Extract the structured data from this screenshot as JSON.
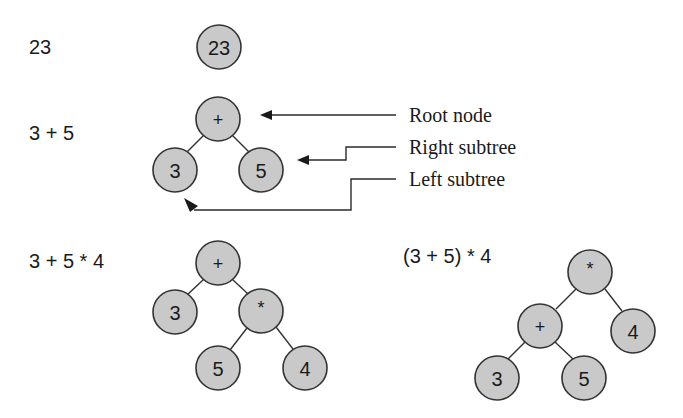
{
  "diagram": {
    "type": "expression-tree-illustration",
    "colors": {
      "node_fill": "#c9c9c9",
      "node_stroke": "#333333",
      "text": "#1a1a1a",
      "background": "#ffffff"
    },
    "examples": [
      {
        "expression": "23",
        "nodes": [
          {
            "id": "n23",
            "label": "23",
            "cx": 219,
            "cy": 47
          }
        ],
        "edges": []
      },
      {
        "expression": "3 + 5",
        "nodes": [
          {
            "id": "plus",
            "label": "+",
            "cx": 218,
            "cy": 119
          },
          {
            "id": "three",
            "label": "3",
            "cx": 175,
            "cy": 170
          },
          {
            "id": "five",
            "label": "5",
            "cx": 261,
            "cy": 170
          }
        ],
        "edges": [
          [
            "plus",
            "three"
          ],
          [
            "plus",
            "five"
          ]
        ]
      },
      {
        "expression": "3 + 5 * 4",
        "nodes": [
          {
            "id": "plus",
            "label": "+",
            "cx": 218,
            "cy": 263
          },
          {
            "id": "three",
            "label": "3",
            "cx": 175,
            "cy": 312
          },
          {
            "id": "times",
            "label": "*",
            "cx": 261,
            "cy": 311
          },
          {
            "id": "five",
            "label": "5",
            "cx": 218,
            "cy": 368
          },
          {
            "id": "four",
            "label": "4",
            "cx": 305,
            "cy": 368
          }
        ],
        "edges": [
          [
            "plus",
            "three"
          ],
          [
            "plus",
            "times"
          ],
          [
            "times",
            "five"
          ],
          [
            "times",
            "four"
          ]
        ]
      },
      {
        "expression": "(3 + 5) * 4",
        "nodes": [
          {
            "id": "times",
            "label": "*",
            "cx": 590,
            "cy": 272
          },
          {
            "id": "plus",
            "label": "+",
            "cx": 540,
            "cy": 326
          },
          {
            "id": "four",
            "label": "4",
            "cx": 633,
            "cy": 331
          },
          {
            "id": "three",
            "label": "3",
            "cx": 497,
            "cy": 378
          },
          {
            "id": "five",
            "label": "5",
            "cx": 584,
            "cy": 378
          }
        ],
        "edges": [
          [
            "times",
            "plus"
          ],
          [
            "times",
            "four"
          ],
          [
            "plus",
            "three"
          ],
          [
            "plus",
            "five"
          ]
        ]
      }
    ],
    "callouts": [
      {
        "label": "Root node",
        "target": "root of 3 + 5"
      },
      {
        "label": "Right subtree",
        "target": "right child of 3 + 5"
      },
      {
        "label": "Left subtree",
        "target": "left child of 3 + 5"
      }
    ]
  },
  "labels": {
    "expr_23": "23",
    "expr_3_plus_5": "3 + 5",
    "expr_3_plus_5_times_4": "3 + 5 * 4",
    "expr_paren": "(3 + 5) * 4",
    "callout_root": "Root node",
    "callout_right": "Right subtree",
    "callout_left": "Left subtree"
  },
  "nodes": {
    "t1": {
      "n23": "23"
    },
    "t2": {
      "plus": "+",
      "three": "3",
      "five": "5"
    },
    "t3": {
      "plus": "+",
      "three": "3",
      "times": "*",
      "five": "5",
      "four": "4"
    },
    "t4": {
      "times": "*",
      "plus": "+",
      "four": "4",
      "three": "3",
      "five": "5"
    }
  }
}
